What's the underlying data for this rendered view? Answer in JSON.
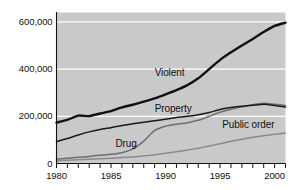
{
  "chart_data": {
    "type": "line",
    "title": "",
    "xlabel": "",
    "ylabel": "",
    "xlim": [
      1980,
      2001
    ],
    "ylim": [
      0,
      640000
    ],
    "grid": true,
    "grid_orientation": "horizontal",
    "legend_position": "inline-on-curves",
    "plot_background": "#c9c9c9",
    "gridline_color": "#ffffff",
    "y_ticks": [
      0,
      200000,
      400000,
      600000
    ],
    "y_tick_labels": [
      "0",
      "200,000",
      "400,000",
      "600,000"
    ],
    "x_ticks": [
      1980,
      1981,
      1982,
      1983,
      1984,
      1985,
      1986,
      1987,
      1988,
      1989,
      1990,
      1991,
      1992,
      1993,
      1994,
      1995,
      1996,
      1997,
      1998,
      1999,
      2000,
      2001
    ],
    "x_tick_labels_shown": [
      "1980",
      "1985",
      "1990",
      "1995",
      "2000"
    ],
    "x_labeled_ticks": [
      1980,
      1985,
      1990,
      1995,
      2000
    ],
    "x": [
      1980,
      1981,
      1982,
      1983,
      1984,
      1985,
      1986,
      1987,
      1988,
      1989,
      1990,
      1991,
      1992,
      1993,
      1994,
      1995,
      1996,
      1997,
      1998,
      1999,
      2000,
      2001
    ],
    "series": [
      {
        "name": "Violent",
        "color": "#111111",
        "width": 2.4,
        "label": "Violent",
        "values": [
          173300,
          185000,
          203000,
          201000,
          212000,
          222000,
          238000,
          249000,
          262000,
          276000,
          293000,
          311000,
          332000,
          361000,
          400000,
          439000,
          471000,
          500000,
          528000,
          557000,
          583000,
          597000
        ]
      },
      {
        "name": "Property",
        "color": "#1a1a1a",
        "width": 1.5,
        "label": "Property",
        "values": [
          93000,
          106000,
          121000,
          134000,
          144000,
          152000,
          161000,
          168000,
          175000,
          181000,
          188000,
          195000,
          200000,
          207000,
          216000,
          229000,
          237000,
          243000,
          247000,
          251000,
          246000,
          239000
        ]
      },
      {
        "name": "Drug",
        "color": "#6e6e6e",
        "width": 1.5,
        "label": "Drug",
        "values": [
          19000,
          22000,
          26000,
          30000,
          35000,
          39000,
          46000,
          62000,
          95000,
          140000,
          158000,
          166000,
          173000,
          183000,
          200000,
          217000,
          230000,
          240000,
          249000,
          255000,
          251000,
          246000
        ]
      },
      {
        "name": "Public order",
        "color": "#8a8a8a",
        "width": 1.5,
        "label": "Public order",
        "values": [
          12000,
          14000,
          16000,
          18000,
          20000,
          22000,
          25000,
          28000,
          32000,
          37000,
          43000,
          50000,
          57000,
          65000,
          74000,
          84000,
          94000,
          103000,
          111000,
          118000,
          124000,
          129000
        ]
      }
    ],
    "annotations": [
      {
        "text": "Violent",
        "x": 1989.0,
        "y": 380000
      },
      {
        "text": "Property",
        "x": 1989.0,
        "y": 228000
      },
      {
        "text": "Drug",
        "x": 1985.4,
        "y": 78000
      },
      {
        "text": "Public order",
        "x": 1995.2,
        "y": 160000
      }
    ]
  }
}
